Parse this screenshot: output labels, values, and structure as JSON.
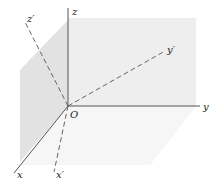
{
  "figure": {
    "origin_label": "O",
    "axes": {
      "x": "x",
      "y": "y",
      "z": "z",
      "x_prime": "x′",
      "y_prime": "y′",
      "z_prime": "z′"
    },
    "colors": {
      "axis_line": "#555555",
      "dashed_line": "#555555",
      "plane_back": "#efefef",
      "plane_left": "#e2e2e2",
      "plane_bottom": "#f7f7f7"
    }
  }
}
